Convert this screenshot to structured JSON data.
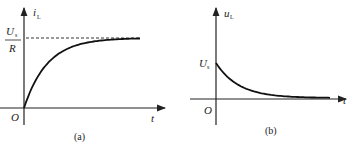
{
  "panels": [
    {
      "id": "a",
      "caption": "(a)",
      "y_axis_label": "i",
      "y_axis_sub": "L",
      "x_axis_label": "t",
      "origin_label": "O",
      "level_label_num": "U",
      "level_label_num_sub": "s",
      "level_label_den": "R",
      "curve": "rising exponential approaching Us/R"
    },
    {
      "id": "b",
      "caption": "(b)",
      "y_axis_label": "u",
      "y_axis_sub": "L",
      "x_axis_label": "t",
      "origin_label": "O",
      "start_label": "U",
      "start_label_sub": "s",
      "curve": "decaying exponential from Us to 0"
    }
  ],
  "chart_data": [
    {
      "type": "line",
      "title": "(a)",
      "xlabel": "t",
      "ylabel": "i_L",
      "annotations": [
        "Us/R asymptote (dashed)",
        "O"
      ],
      "function": "i_L = (Us/R)(1 - e^(-t/tau))",
      "series": [
        {
          "name": "i_L",
          "x": [
            0,
            0.5,
            1,
            1.5,
            2,
            3,
            4,
            5
          ],
          "y": [
            0,
            0.39,
            0.63,
            0.78,
            0.86,
            0.95,
            0.98,
            0.99
          ]
        }
      ],
      "ylim": [
        0,
        1
      ]
    },
    {
      "type": "line",
      "title": "(b)",
      "xlabel": "t",
      "ylabel": "u_L",
      "annotations": [
        "Us",
        "O"
      ],
      "function": "u_L = Us e^(-t/tau)",
      "series": [
        {
          "name": "u_L",
          "x": [
            0,
            0.5,
            1,
            1.5,
            2,
            3,
            4,
            5
          ],
          "y": [
            1,
            0.61,
            0.37,
            0.22,
            0.14,
            0.05,
            0.02,
            0.01
          ]
        }
      ],
      "ylim": [
        0,
        1
      ]
    }
  ]
}
